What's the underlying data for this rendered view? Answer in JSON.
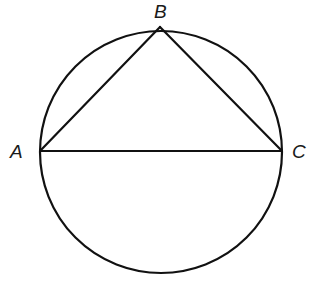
{
  "diagram": {
    "type": "geometry",
    "circle": {
      "cx": 161,
      "cy": 152,
      "r": 121
    },
    "points": [
      {
        "id": "A",
        "label": "A",
        "x": 40,
        "y": 151,
        "label_x": 10,
        "label_y": 158
      },
      {
        "id": "B",
        "label": "B",
        "x": 160,
        "y": 27,
        "label_x": 154,
        "label_y": 18
      },
      {
        "id": "C",
        "label": "C",
        "x": 282,
        "y": 151,
        "label_x": 292,
        "label_y": 158
      }
    ],
    "segments": [
      {
        "from": "A",
        "to": "B"
      },
      {
        "from": "B",
        "to": "C"
      },
      {
        "from": "A",
        "to": "C"
      }
    ],
    "stroke_color": "#111111",
    "stroke_width": 2.2
  }
}
